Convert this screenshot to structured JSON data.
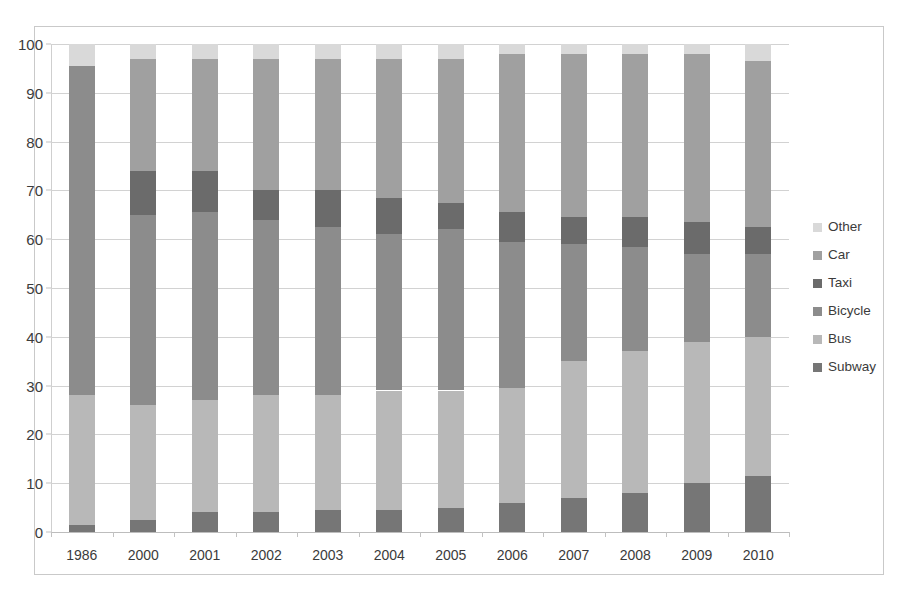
{
  "chart_data": {
    "type": "bar",
    "stacked": true,
    "stack_total": 100,
    "title": "",
    "subtitle": "",
    "xlabel": "",
    "ylabel": "",
    "ylim": [
      0,
      100
    ],
    "ytick_step": 10,
    "grid": true,
    "legend_position": "right",
    "categories": [
      "1986",
      "2000",
      "2001",
      "2002",
      "2003",
      "2004",
      "2005",
      "2006",
      "2007",
      "2008",
      "2009",
      "2010"
    ],
    "ytick_labels": [
      "0",
      "10",
      "20",
      "30",
      "40",
      "50",
      "60",
      "70",
      "80",
      "90",
      "100"
    ],
    "series": [
      {
        "name": "Subway",
        "color": "#767676",
        "values": [
          1.5,
          2.5,
          4.0,
          4.0,
          4.5,
          4.5,
          5.0,
          6.0,
          7.0,
          8.0,
          10.0,
          11.5
        ]
      },
      {
        "name": "Bus",
        "color": "#b8b8b8",
        "values": [
          26.5,
          23.5,
          23.0,
          24.0,
          23.5,
          24.5,
          24.0,
          23.5,
          28.0,
          29.0,
          29.0,
          28.5
        ]
      },
      {
        "name": "Bicycle",
        "color": "#8c8c8c",
        "values": [
          67.5,
          39.0,
          38.5,
          36.0,
          34.5,
          32.0,
          33.0,
          30.0,
          24.0,
          21.5,
          18.0,
          17.0
        ]
      },
      {
        "name": "Taxi",
        "color": "#6b6b6b",
        "values": [
          0.0,
          9.0,
          8.5,
          6.0,
          7.5,
          7.5,
          5.5,
          6.0,
          5.5,
          6.0,
          6.5,
          5.5
        ]
      },
      {
        "name": "Car",
        "color": "#a0a0a0",
        "values": [
          0.0,
          23.0,
          23.0,
          27.0,
          27.0,
          28.5,
          29.5,
          32.5,
          33.5,
          33.5,
          34.5,
          34.0
        ]
      },
      {
        "name": "Other",
        "color": "#d9d9d9",
        "values": [
          4.5,
          3.0,
          3.0,
          3.0,
          3.0,
          3.0,
          3.0,
          2.0,
          2.0,
          2.0,
          2.0,
          3.5
        ]
      }
    ]
  },
  "legend": {
    "items": [
      {
        "label": "Other",
        "color": "#d9d9d9"
      },
      {
        "label": "Car",
        "color": "#a0a0a0"
      },
      {
        "label": "Taxi",
        "color": "#6b6b6b"
      },
      {
        "label": "Bicycle",
        "color": "#8c8c8c"
      },
      {
        "label": "Bus",
        "color": "#b8b8b8"
      },
      {
        "label": "Subway",
        "color": "#767676"
      }
    ]
  }
}
